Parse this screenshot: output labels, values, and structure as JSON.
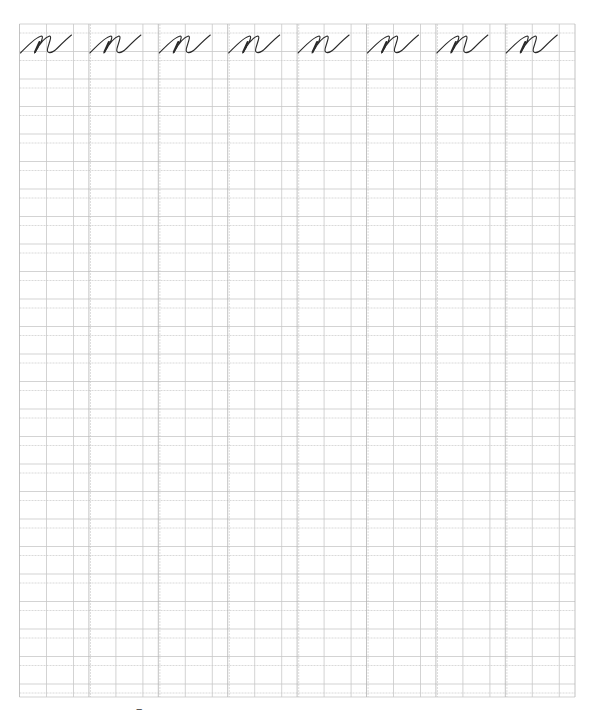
{
  "worksheet": {
    "type": "cursive handwriting practice sheet",
    "letter": "n",
    "letter_count": 8,
    "grid": {
      "left": 19.5,
      "right": 575,
      "top": 24,
      "bottom": 697,
      "column_groups": 8,
      "group_width": 69.4,
      "sub_column_offsets": [
        27,
        54
      ],
      "row_pair_period": 27.5,
      "row_pair_gap": 9,
      "first_row_y": 24,
      "line_color": "#c8c8c8",
      "group_line_color": "#b4b4b4"
    },
    "ink_color": "#2a2a2a",
    "page_mark": {
      "text": "‒",
      "x": 136,
      "y": 704
    }
  }
}
